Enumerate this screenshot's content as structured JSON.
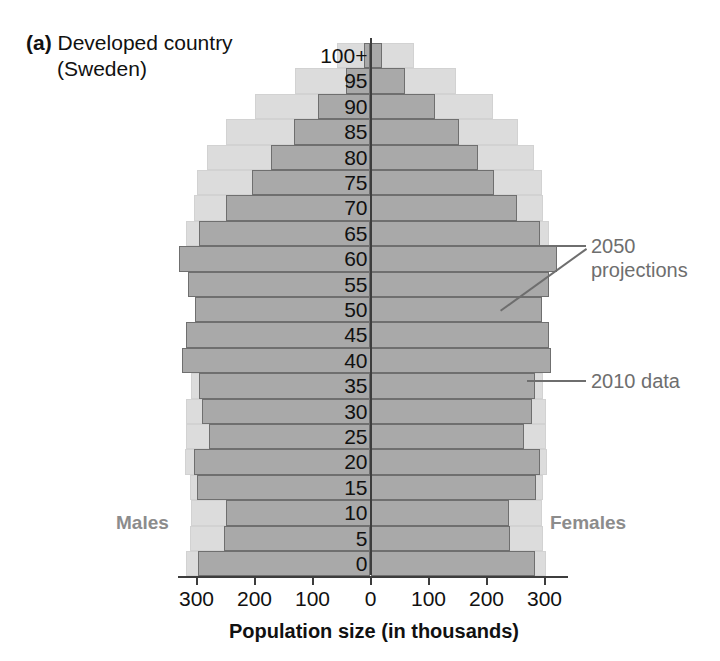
{
  "panel": {
    "letter": "(a)",
    "title_line1": "Developed country",
    "title_line2": "(Sweden)"
  },
  "labels": {
    "males": "Males",
    "females": "Females",
    "axis_caption": "Population size (in thousands)"
  },
  "annotations": {
    "projections": "2050\nprojections",
    "projections_line1": "2050",
    "projections_line2": "projections",
    "data_2010": "2010 data"
  },
  "chart_data": {
    "type": "bar",
    "subtype": "population-pyramid",
    "title": "(a) Developed country (Sweden)",
    "xlabel": "Population size (in thousands)",
    "ylabel": "Age",
    "xlim": [
      -330,
      330
    ],
    "xticks": [
      -300,
      -200,
      -100,
      0,
      100,
      200,
      300
    ],
    "xtick_labels": [
      "300",
      "200",
      "100",
      "0",
      "100",
      "200",
      "300"
    ],
    "grid": false,
    "legend_position": "annotations-right",
    "categories": [
      "0",
      "5",
      "10",
      "15",
      "20",
      "25",
      "30",
      "35",
      "40",
      "45",
      "50",
      "55",
      "60",
      "65",
      "70",
      "75",
      "80",
      "85",
      "90",
      "95",
      "100+"
    ],
    "series": [
      {
        "name": "2010 data",
        "color": "#a9a9a9",
        "males": [
          297,
          252,
          250,
          300,
          305,
          278,
          290,
          295,
          325,
          318,
          303,
          315,
          330,
          295,
          250,
          205,
          172,
          132,
          90,
          42,
          12
        ],
        "females": [
          283,
          240,
          238,
          285,
          292,
          265,
          278,
          283,
          312,
          308,
          295,
          307,
          322,
          292,
          252,
          213,
          185,
          152,
          112,
          60,
          20
        ]
      },
      {
        "name": "2050 projections",
        "color": "#dcdcdc",
        "males": [
          318,
          312,
          310,
          312,
          320,
          318,
          318,
          310,
          310,
          305,
          300,
          312,
          328,
          318,
          305,
          300,
          282,
          250,
          200,
          130,
          58
        ],
        "females": [
          302,
          297,
          295,
          297,
          305,
          303,
          303,
          297,
          297,
          293,
          288,
          300,
          316,
          308,
          298,
          296,
          282,
          255,
          212,
          148,
          75
        ]
      }
    ]
  }
}
